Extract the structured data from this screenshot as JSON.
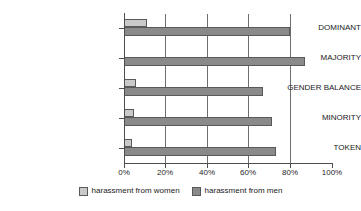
{
  "chart_data": {
    "type": "bar",
    "orientation": "horizontal",
    "title": "",
    "xlabel": "",
    "ylabel": "",
    "xlim": [
      0,
      100
    ],
    "xticks": [
      0,
      20,
      40,
      60,
      80,
      100
    ],
    "xtick_labels": [
      "0%",
      "20%",
      "40%",
      "60%",
      "80%",
      "100%"
    ],
    "grid": "vertical",
    "legend_position": "bottom-center",
    "categories": [
      "DOMINANT",
      "MAJORITY",
      "GENDER BALANCE",
      "MINORITY",
      "TOKEN"
    ],
    "series": [
      {
        "name": "harassment from women",
        "color": "#c9c9c9",
        "values": [
          11,
          0,
          6,
          5,
          4
        ]
      },
      {
        "name": "harassment from men",
        "color": "#8a8a8a",
        "values": [
          80,
          87,
          67,
          71,
          73
        ]
      }
    ]
  },
  "legend": {
    "items": [
      {
        "label": "harassment from women",
        "swatch": "women"
      },
      {
        "label": "harassment from men",
        "swatch": "men"
      }
    ]
  }
}
